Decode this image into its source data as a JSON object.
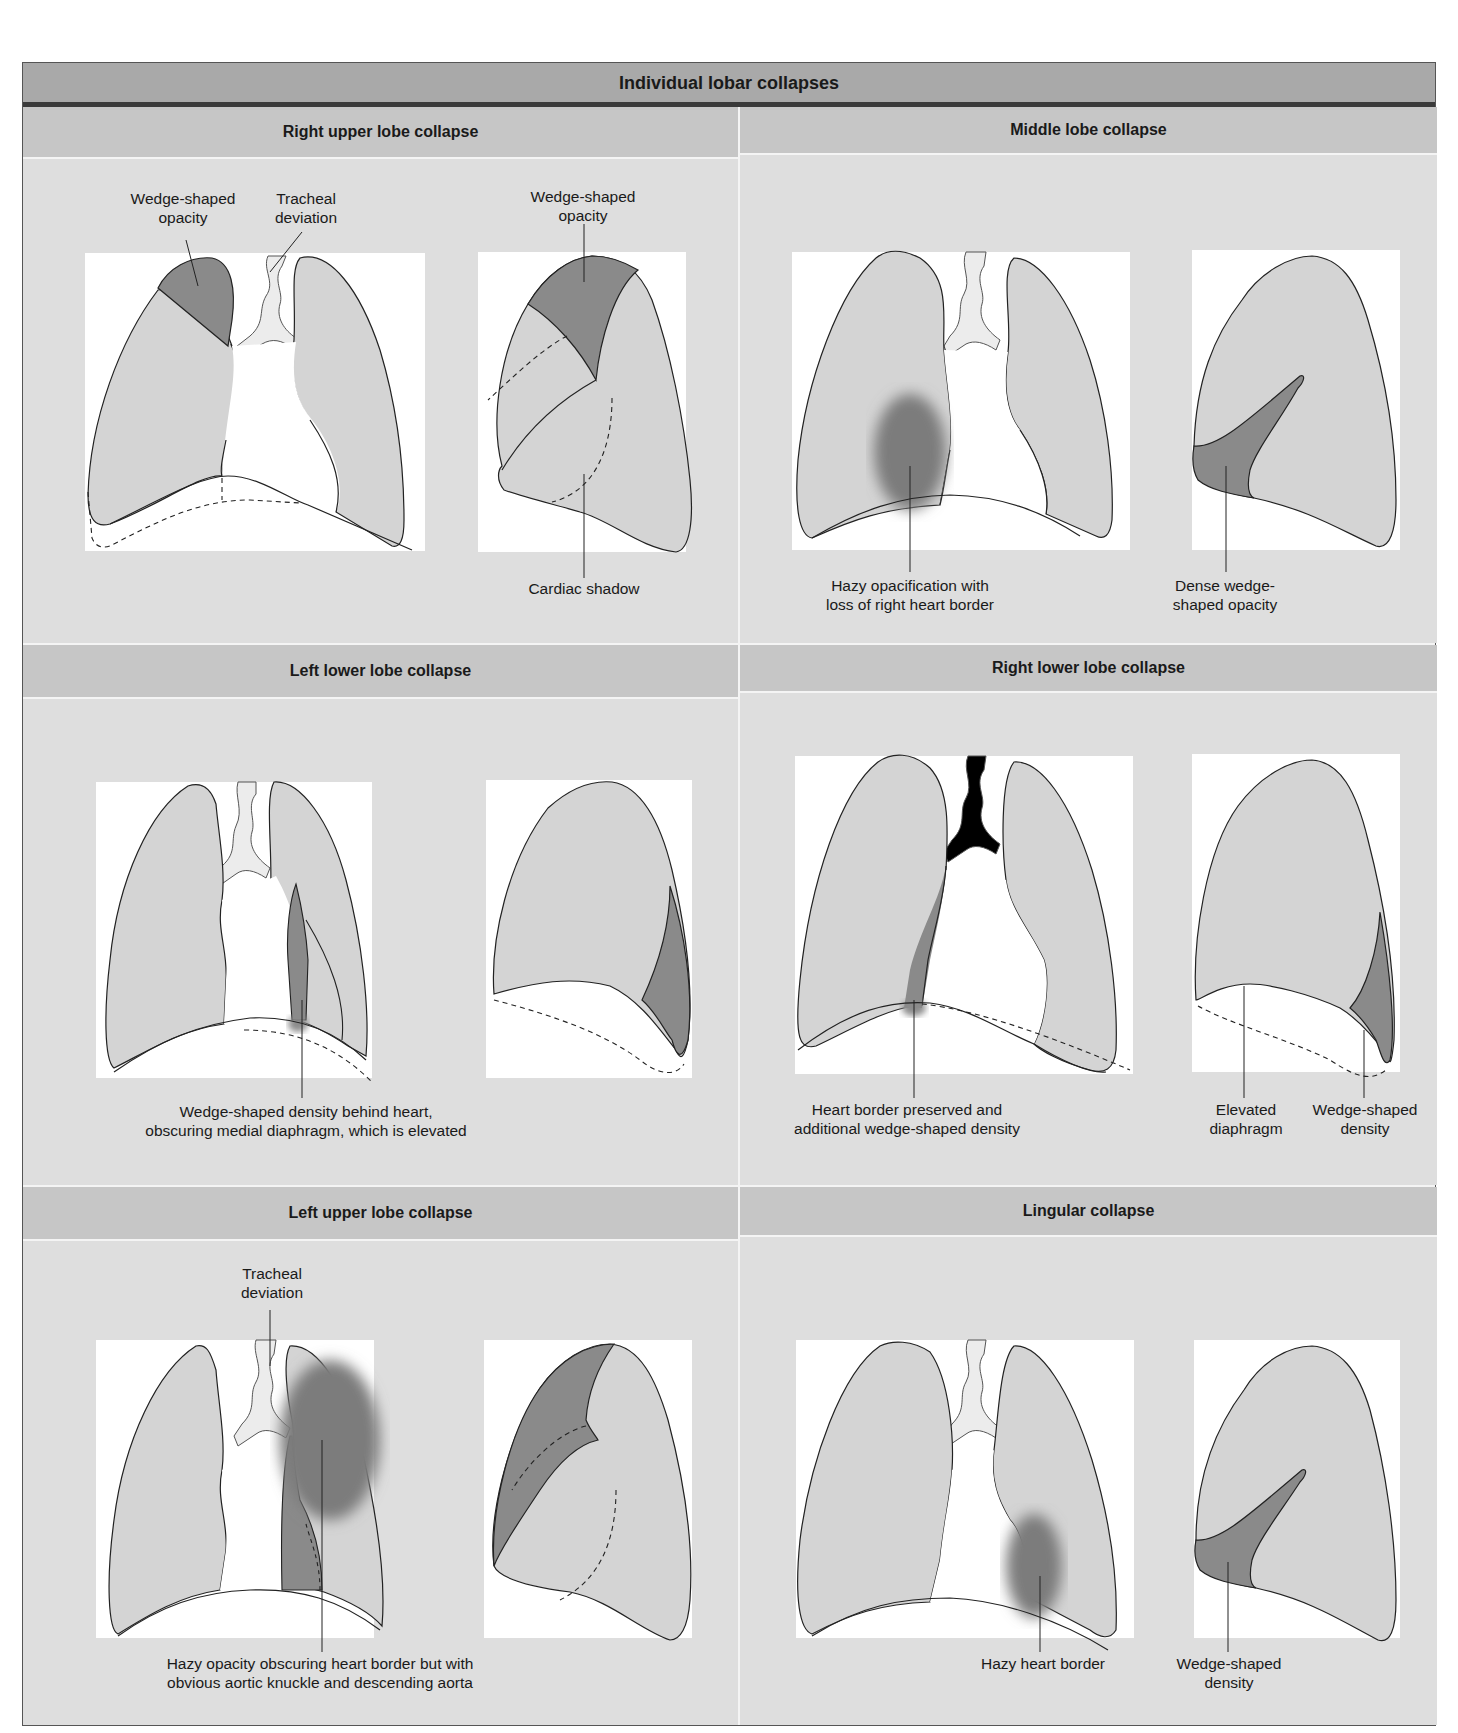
{
  "title": "Individual lobar collapses",
  "colors": {
    "lung_fill": "#d4d4d4",
    "collapse_fill": "#8a8a8a",
    "trachea_fill": "#ececec",
    "panel_bg": "#dedede",
    "header_bg": "#c6c6c6",
    "title_bg": "#a9a9a9"
  },
  "panels": [
    {
      "id": "right-upper-lobe",
      "heading": "Right upper lobe collapse",
      "labels": {
        "frontal_opacity": "Wedge-shaped\nopacity",
        "tracheal": "Tracheal\ndeviation",
        "lateral_opacity": "Wedge-shaped\nopacity",
        "cardiac": "Cardiac shadow"
      }
    },
    {
      "id": "middle-lobe",
      "heading": "Middle lobe collapse",
      "labels": {
        "frontal": "Hazy opacification with\nloss of right heart border",
        "lateral": "Dense wedge-\nshaped opacity"
      }
    },
    {
      "id": "left-lower-lobe",
      "heading": "Left lower lobe collapse",
      "labels": {
        "frontal": "Wedge-shaped density behind heart,\nobscuring medial diaphragm, which is elevated"
      }
    },
    {
      "id": "right-lower-lobe",
      "heading": "Right lower lobe collapse",
      "labels": {
        "frontal": "Heart border preserved and\nadditional wedge-shaped density",
        "elevated": "Elevated\ndiaphragm",
        "wedge": "Wedge-shaped\ndensity"
      }
    },
    {
      "id": "left-upper-lobe",
      "heading": "Left upper lobe collapse",
      "labels": {
        "tracheal": "Tracheal\ndeviation",
        "frontal": "Hazy opacity obscuring heart border but with\nobvious aortic knuckle and descending aorta"
      }
    },
    {
      "id": "lingular",
      "heading": "Lingular collapse",
      "labels": {
        "frontal": "Hazy heart border",
        "lateral": "Wedge-shaped\ndensity"
      }
    }
  ]
}
